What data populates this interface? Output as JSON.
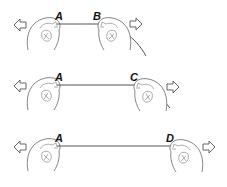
{
  "diagram": {
    "rows": [
      {
        "left_label": "A",
        "right_label": "B",
        "left_arrow": "arrow-left-icon",
        "right_arrow": "arrow-right-icon"
      },
      {
        "left_label": "A",
        "right_label": "C",
        "left_arrow": "arrow-left-icon",
        "right_arrow": "arrow-right-icon"
      },
      {
        "left_label": "A",
        "right_label": "D",
        "left_arrow": "arrow-left-icon",
        "right_arrow": "arrow-right-icon"
      }
    ]
  }
}
